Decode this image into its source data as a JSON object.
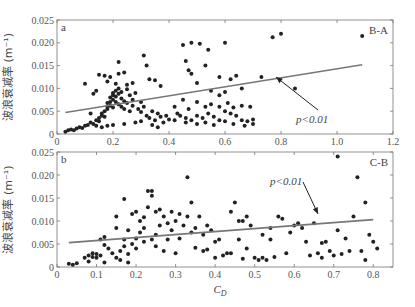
{
  "chart_data": [
    {
      "type": "scatter",
      "panel_label": "a",
      "corner_label": "B-A",
      "ylabel": "波浪衰减率 (m⁻¹)",
      "xlabel": "",
      "xlim": [
        0,
        1.2
      ],
      "ylim": [
        0,
        0.025
      ],
      "xticks": [
        "0",
        "0.2",
        "0.4",
        "0.6",
        "0.8",
        "1.0",
        "1.2"
      ],
      "yticks": [
        "0",
        "0.005",
        "0.010",
        "0.015",
        "0.020",
        "0.025"
      ],
      "annotation": "p<0.01",
      "fit_line": {
        "x": [
          0.03,
          1.09
        ],
        "y": [
          0.0047,
          0.0152
        ]
      },
      "points": [
        [
          0.03,
          0.0005
        ],
        [
          0.04,
          0.0008
        ],
        [
          0.05,
          0.001
        ],
        [
          0.06,
          0.0008
        ],
        [
          0.07,
          0.0012
        ],
        [
          0.08,
          0.0015
        ],
        [
          0.09,
          0.0013
        ],
        [
          0.1,
          0.0018
        ],
        [
          0.11,
          0.002
        ],
        [
          0.12,
          0.0025
        ],
        [
          0.13,
          0.0022
        ],
        [
          0.14,
          0.003
        ],
        [
          0.15,
          0.0035
        ],
        [
          0.15,
          0.0028
        ],
        [
          0.16,
          0.004
        ],
        [
          0.16,
          0.0045
        ],
        [
          0.17,
          0.005
        ],
        [
          0.17,
          0.0038
        ],
        [
          0.18,
          0.0055
        ],
        [
          0.18,
          0.006
        ],
        [
          0.18,
          0.0068
        ],
        [
          0.19,
          0.007
        ],
        [
          0.19,
          0.008
        ],
        [
          0.19,
          0.0062
        ],
        [
          0.2,
          0.0075
        ],
        [
          0.2,
          0.0085
        ],
        [
          0.2,
          0.009
        ],
        [
          0.2,
          0.0058
        ],
        [
          0.21,
          0.0095
        ],
        [
          0.21,
          0.007
        ],
        [
          0.21,
          0.0082
        ],
        [
          0.22,
          0.01
        ],
        [
          0.22,
          0.0065
        ],
        [
          0.22,
          0.0088
        ],
        [
          0.23,
          0.0078
        ],
        [
          0.23,
          0.006
        ],
        [
          0.23,
          0.0092
        ],
        [
          0.24,
          0.0072
        ],
        [
          0.24,
          0.0055
        ],
        [
          0.25,
          0.0068
        ],
        [
          0.25,
          0.0098
        ],
        [
          0.26,
          0.0085
        ],
        [
          0.26,
          0.005
        ],
        [
          0.27,
          0.0075
        ],
        [
          0.27,
          0.0062
        ],
        [
          0.28,
          0.009
        ],
        [
          0.29,
          0.0055
        ],
        [
          0.3,
          0.007
        ],
        [
          0.3,
          0.0048
        ],
        [
          0.31,
          0.006
        ],
        [
          0.32,
          0.004
        ],
        [
          0.33,
          0.0035
        ],
        [
          0.34,
          0.005
        ],
        [
          0.35,
          0.003
        ],
        [
          0.36,
          0.0045
        ],
        [
          0.37,
          0.0038
        ],
        [
          0.38,
          0.0025
        ],
        [
          0.39,
          0.004
        ],
        [
          0.4,
          0.0032
        ],
        [
          0.15,
          0.013
        ],
        [
          0.17,
          0.0128
        ],
        [
          0.18,
          0.0115
        ],
        [
          0.19,
          0.0125
        ],
        [
          0.21,
          0.011
        ],
        [
          0.22,
          0.0132
        ],
        [
          0.22,
          0.0158
        ],
        [
          0.24,
          0.0135
        ],
        [
          0.25,
          0.0108
        ],
        [
          0.27,
          0.0112
        ],
        [
          0.31,
          0.0172
        ],
        [
          0.32,
          0.015
        ],
        [
          0.33,
          0.012
        ],
        [
          0.35,
          0.0118
        ],
        [
          0.37,
          0.0105
        ],
        [
          0.1,
          0.011
        ],
        [
          0.13,
          0.0088
        ],
        [
          0.14,
          0.0095
        ],
        [
          0.12,
          0.0045
        ],
        [
          0.14,
          0.0018
        ],
        [
          0.16,
          0.0015
        ],
        [
          0.18,
          0.0018
        ],
        [
          0.2,
          0.002
        ],
        [
          0.24,
          0.0022
        ],
        [
          0.28,
          0.0025
        ],
        [
          0.3,
          0.0028
        ],
        [
          0.34,
          0.002
        ],
        [
          0.36,
          0.0015
        ],
        [
          0.42,
          0.003
        ],
        [
          0.44,
          0.004
        ],
        [
          0.46,
          0.0035
        ],
        [
          0.48,
          0.003
        ],
        [
          0.5,
          0.004
        ],
        [
          0.52,
          0.0035
        ],
        [
          0.54,
          0.0045
        ],
        [
          0.56,
          0.0038
        ],
        [
          0.58,
          0.003
        ],
        [
          0.6,
          0.005
        ],
        [
          0.62,
          0.0045
        ],
        [
          0.64,
          0.004
        ],
        [
          0.66,
          0.003
        ],
        [
          0.68,
          0.0028
        ],
        [
          0.7,
          0.0032
        ],
        [
          0.42,
          0.006
        ],
        [
          0.45,
          0.0075
        ],
        [
          0.47,
          0.0055
        ],
        [
          0.5,
          0.007
        ],
        [
          0.53,
          0.006
        ],
        [
          0.55,
          0.0065
        ],
        [
          0.58,
          0.006
        ],
        [
          0.61,
          0.0068
        ],
        [
          0.63,
          0.0058
        ],
        [
          0.66,
          0.0062
        ],
        [
          0.69,
          0.006
        ],
        [
          0.46,
          0.016
        ],
        [
          0.47,
          0.014
        ],
        [
          0.48,
          0.0132
        ],
        [
          0.5,
          0.0112
        ],
        [
          0.53,
          0.015
        ],
        [
          0.55,
          0.0095
        ],
        [
          0.58,
          0.0085
        ],
        [
          0.6,
          0.0092
        ],
        [
          0.62,
          0.012
        ],
        [
          0.66,
          0.01
        ],
        [
          0.45,
          0.0195
        ],
        [
          0.48,
          0.02
        ],
        [
          0.51,
          0.0198
        ],
        [
          0.54,
          0.0185
        ],
        [
          0.6,
          0.02
        ],
        [
          0.58,
          0.0125
        ],
        [
          0.64,
          0.0128
        ],
        [
          0.73,
          0.0125
        ],
        [
          0.77,
          0.0212
        ],
        [
          0.8,
          0.022
        ],
        [
          0.85,
          0.01
        ],
        [
          1.09,
          0.0215
        ],
        [
          0.43,
          0.0045
        ],
        [
          0.46,
          0.0025
        ],
        [
          0.5,
          0.0022
        ],
        [
          0.53,
          0.0025
        ],
        [
          0.56,
          0.002
        ],
        [
          0.6,
          0.0028
        ],
        [
          0.63,
          0.0022
        ],
        [
          0.67,
          0.0018
        ],
        [
          0.7,
          0.0022
        ]
      ]
    },
    {
      "type": "scatter",
      "panel_label": "b",
      "corner_label": "C-B",
      "ylabel": "波浪衰减率 (m⁻¹)",
      "xlabel": "C_D",
      "xlim": [
        0,
        0.85
      ],
      "ylim": [
        0,
        0.025
      ],
      "xticks": [
        "0",
        "0.1",
        "0.2",
        "0.3",
        "0.4",
        "0.5",
        "0.6",
        "0.7",
        "0.8"
      ],
      "yticks": [
        "0",
        "0.005",
        "0.010",
        "0.015",
        "0.020",
        "0.025"
      ],
      "annotation": "p<0.01",
      "fit_line": {
        "x": [
          0.03,
          0.8
        ],
        "y": [
          0.0053,
          0.0103
        ]
      },
      "points": [
        [
          0.03,
          0.0007
        ],
        [
          0.04,
          0.0005
        ],
        [
          0.05,
          0.0008
        ],
        [
          0.07,
          0.002
        ],
        [
          0.08,
          0.0025
        ],
        [
          0.08,
          0.0012
        ],
        [
          0.09,
          0.003
        ],
        [
          0.09,
          0.0022
        ],
        [
          0.1,
          0.0028
        ],
        [
          0.1,
          0.002
        ],
        [
          0.11,
          0.0025
        ],
        [
          0.11,
          0.006
        ],
        [
          0.12,
          0.0065
        ],
        [
          0.12,
          0.0048
        ],
        [
          0.12,
          0.001
        ],
        [
          0.13,
          0.004
        ],
        [
          0.14,
          0.003
        ],
        [
          0.15,
          0.0085
        ],
        [
          0.15,
          0.002
        ],
        [
          0.15,
          0.011
        ],
        [
          0.16,
          0.0035
        ],
        [
          0.16,
          0.0015
        ],
        [
          0.17,
          0.0148
        ],
        [
          0.17,
          0.0045
        ],
        [
          0.17,
          0.006
        ],
        [
          0.18,
          0.008
        ],
        [
          0.18,
          0.0028
        ],
        [
          0.18,
          0.001
        ],
        [
          0.19,
          0.005
        ],
        [
          0.19,
          0.0115
        ],
        [
          0.2,
          0.012
        ],
        [
          0.2,
          0.0062
        ],
        [
          0.2,
          0.004
        ],
        [
          0.21,
          0.0075
        ],
        [
          0.21,
          0.01
        ],
        [
          0.22,
          0.0085
        ],
        [
          0.22,
          0.0055
        ],
        [
          0.22,
          0.0108
        ],
        [
          0.23,
          0.0165
        ],
        [
          0.23,
          0.013
        ],
        [
          0.24,
          0.0165
        ],
        [
          0.24,
          0.0155
        ],
        [
          0.24,
          0.006
        ],
        [
          0.25,
          0.012
        ],
        [
          0.25,
          0.007
        ],
        [
          0.25,
          0.0045
        ],
        [
          0.26,
          0.0125
        ],
        [
          0.26,
          0.009
        ],
        [
          0.27,
          0.011
        ],
        [
          0.27,
          0.0035
        ],
        [
          0.28,
          0.0095
        ],
        [
          0.28,
          0.006
        ],
        [
          0.29,
          0.012
        ],
        [
          0.29,
          0.008
        ],
        [
          0.3,
          0.01
        ],
        [
          0.3,
          0.003
        ],
        [
          0.31,
          0.0115
        ],
        [
          0.31,
          0.0062
        ],
        [
          0.32,
          0.009
        ],
        [
          0.33,
          0.0195
        ],
        [
          0.33,
          0.011
        ],
        [
          0.34,
          0.014
        ],
        [
          0.34,
          0.0075
        ],
        [
          0.35,
          0.0042
        ],
        [
          0.35,
          0.0085
        ],
        [
          0.36,
          0.011
        ],
        [
          0.37,
          0.007
        ],
        [
          0.37,
          0.0035
        ],
        [
          0.38,
          0.009
        ],
        [
          0.38,
          0.0038
        ],
        [
          0.39,
          0.008
        ],
        [
          0.4,
          0.0055
        ],
        [
          0.4,
          0.002
        ],
        [
          0.41,
          0.006
        ],
        [
          0.42,
          0.0025
        ],
        [
          0.43,
          0.003
        ],
        [
          0.44,
          0.012
        ],
        [
          0.44,
          0.003
        ],
        [
          0.45,
          0.014
        ],
        [
          0.46,
          0.01
        ],
        [
          0.46,
          0.006
        ],
        [
          0.47,
          0.01
        ],
        [
          0.47,
          0.0018
        ],
        [
          0.48,
          0.011
        ],
        [
          0.48,
          0.004
        ],
        [
          0.49,
          0.009
        ],
        [
          0.5,
          0.002
        ],
        [
          0.51,
          0.0015
        ],
        [
          0.52,
          0.002
        ],
        [
          0.52,
          0.007
        ],
        [
          0.53,
          0.0015
        ],
        [
          0.54,
          0.0085
        ],
        [
          0.54,
          0.006
        ],
        [
          0.55,
          0.0022
        ],
        [
          0.56,
          0.011
        ],
        [
          0.57,
          0.0105
        ],
        [
          0.58,
          0.003
        ],
        [
          0.59,
          0.0075
        ],
        [
          0.6,
          0.009
        ],
        [
          0.61,
          0.0095
        ],
        [
          0.62,
          0.0085
        ],
        [
          0.63,
          0.0055
        ],
        [
          0.64,
          0.0025
        ],
        [
          0.65,
          0.0095
        ],
        [
          0.66,
          0.003
        ],
        [
          0.67,
          0.0052
        ],
        [
          0.67,
          0.002
        ],
        [
          0.68,
          0.0055
        ],
        [
          0.69,
          0.0035
        ],
        [
          0.7,
          0.0025
        ],
        [
          0.71,
          0.024
        ],
        [
          0.71,
          0.008
        ],
        [
          0.72,
          0.0028
        ],
        [
          0.73,
          0.0062
        ],
        [
          0.74,
          0.0035
        ],
        [
          0.75,
          0.011
        ],
        [
          0.76,
          0.0195
        ],
        [
          0.77,
          0.0035
        ],
        [
          0.78,
          0.0015
        ],
        [
          0.78,
          0.014
        ],
        [
          0.79,
          0.007
        ],
        [
          0.8,
          0.0055
        ],
        [
          0.81,
          0.004
        ]
      ]
    }
  ]
}
